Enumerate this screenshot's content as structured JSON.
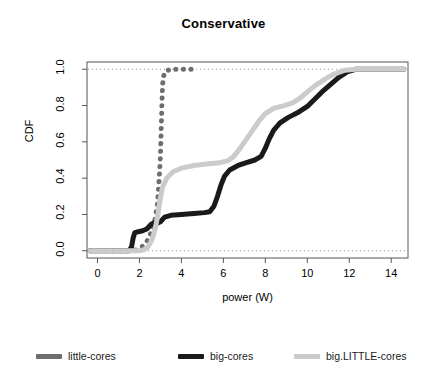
{
  "chart_data": {
    "type": "line",
    "title": "Conservative",
    "xlabel": "power (W)",
    "ylabel": "CDF",
    "xlim": [
      -0.5,
      14.8
    ],
    "ylim": [
      -0.04,
      1.04
    ],
    "xticks": [
      0,
      2,
      4,
      6,
      8,
      10,
      12,
      14
    ],
    "xtick_labels": [
      "0",
      "2",
      "4",
      "6",
      "8",
      "10",
      "12",
      "14"
    ],
    "yticks": [
      0.0,
      0.2,
      0.4,
      0.6,
      0.8,
      1.0
    ],
    "ytick_labels": [
      "0.0",
      "0.2",
      "0.4",
      "0.6",
      "0.8",
      "1.0"
    ],
    "grid": "horizontal dotted at y=0.0 and y=1.0",
    "legend_position": "below-plot",
    "series": [
      {
        "name": "little-cores",
        "color": "#6e6e6e",
        "style": "dotted-thick",
        "points": [
          [
            -0.35,
            0.0
          ],
          [
            0.0,
            0.0
          ],
          [
            1.0,
            0.0
          ],
          [
            1.6,
            0.0
          ],
          [
            1.9,
            0.005
          ],
          [
            2.1,
            0.02
          ],
          [
            2.35,
            0.05
          ],
          [
            2.55,
            0.1
          ],
          [
            2.72,
            0.16
          ],
          [
            2.86,
            0.26
          ],
          [
            2.93,
            0.38
          ],
          [
            2.97,
            0.45
          ],
          [
            3.0,
            0.52
          ],
          [
            3.02,
            0.6
          ],
          [
            3.04,
            0.68
          ],
          [
            3.06,
            0.76
          ],
          [
            3.08,
            0.84
          ],
          [
            3.1,
            0.91
          ],
          [
            3.14,
            0.96
          ],
          [
            3.25,
            0.99
          ],
          [
            3.5,
            1.0
          ],
          [
            4.0,
            1.0
          ],
          [
            4.6,
            1.0
          ]
        ]
      },
      {
        "name": "big-cores",
        "color": "#1a1a1a",
        "style": "solid-thick",
        "points": [
          [
            -0.35,
            0.0
          ],
          [
            0.3,
            0.0
          ],
          [
            1.5,
            0.0
          ],
          [
            1.62,
            0.02
          ],
          [
            1.7,
            0.07
          ],
          [
            1.78,
            0.1
          ],
          [
            1.95,
            0.105
          ],
          [
            2.15,
            0.11
          ],
          [
            2.35,
            0.12
          ],
          [
            2.55,
            0.145
          ],
          [
            2.7,
            0.155
          ],
          [
            2.85,
            0.152
          ],
          [
            3.0,
            0.16
          ],
          [
            3.2,
            0.185
          ],
          [
            3.5,
            0.195
          ],
          [
            4.0,
            0.2
          ],
          [
            4.6,
            0.205
          ],
          [
            5.1,
            0.21
          ],
          [
            5.35,
            0.215
          ],
          [
            5.55,
            0.245
          ],
          [
            5.72,
            0.3
          ],
          [
            5.88,
            0.36
          ],
          [
            6.05,
            0.41
          ],
          [
            6.3,
            0.445
          ],
          [
            6.7,
            0.47
          ],
          [
            7.1,
            0.485
          ],
          [
            7.5,
            0.5
          ],
          [
            7.8,
            0.52
          ],
          [
            8.0,
            0.565
          ],
          [
            8.18,
            0.615
          ],
          [
            8.4,
            0.665
          ],
          [
            8.7,
            0.705
          ],
          [
            9.1,
            0.735
          ],
          [
            9.6,
            0.765
          ],
          [
            10.0,
            0.795
          ],
          [
            10.35,
            0.835
          ],
          [
            10.7,
            0.875
          ],
          [
            11.1,
            0.915
          ],
          [
            11.5,
            0.955
          ],
          [
            11.9,
            0.985
          ],
          [
            12.3,
            1.0
          ],
          [
            13.0,
            1.0
          ],
          [
            14.0,
            1.0
          ],
          [
            14.6,
            1.0
          ]
        ]
      },
      {
        "name": "big.LITTLE-cores",
        "color": "#cbcbcb",
        "style": "solid-thick",
        "points": [
          [
            -0.35,
            0.0
          ],
          [
            0.5,
            0.0
          ],
          [
            1.5,
            0.0
          ],
          [
            2.0,
            0.0
          ],
          [
            2.2,
            0.005
          ],
          [
            2.4,
            0.02
          ],
          [
            2.6,
            0.06
          ],
          [
            2.75,
            0.12
          ],
          [
            2.88,
            0.2
          ],
          [
            2.98,
            0.28
          ],
          [
            3.1,
            0.35
          ],
          [
            3.3,
            0.4
          ],
          [
            3.6,
            0.435
          ],
          [
            4.0,
            0.455
          ],
          [
            4.6,
            0.47
          ],
          [
            5.2,
            0.478
          ],
          [
            5.8,
            0.485
          ],
          [
            6.2,
            0.495
          ],
          [
            6.5,
            0.52
          ],
          [
            6.8,
            0.565
          ],
          [
            7.1,
            0.615
          ],
          [
            7.4,
            0.665
          ],
          [
            7.7,
            0.715
          ],
          [
            8.0,
            0.755
          ],
          [
            8.4,
            0.785
          ],
          [
            8.9,
            0.8
          ],
          [
            9.3,
            0.815
          ],
          [
            9.7,
            0.845
          ],
          [
            10.1,
            0.885
          ],
          [
            10.5,
            0.92
          ],
          [
            10.9,
            0.95
          ],
          [
            11.3,
            0.975
          ],
          [
            11.8,
            0.995
          ],
          [
            12.3,
            1.0
          ],
          [
            13.2,
            1.0
          ],
          [
            14.2,
            1.0
          ],
          [
            14.6,
            1.0
          ]
        ]
      }
    ]
  },
  "legend": {
    "items": [
      {
        "label": "little-cores",
        "color": "#6e6e6e"
      },
      {
        "label": "big-cores",
        "color": "#1a1a1a"
      },
      {
        "label": "big.LITTLE-cores",
        "color": "#cbcbcb"
      }
    ]
  },
  "axis_color": "#555555",
  "grid_color": "#9a9a9a"
}
